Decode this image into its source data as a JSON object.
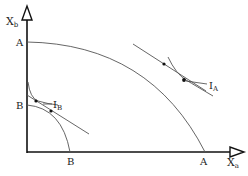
{
  "diagram": {
    "axes": {
      "y_label_main": "X",
      "y_label_sub": "b",
      "x_label_main": "X",
      "x_label_sub": "a"
    },
    "labels": {
      "ppf_a_y_intercept": "A",
      "ppf_a_x_intercept": "A",
      "ppf_b_y_intercept": "B",
      "ppf_b_x_intercept": "B",
      "indifference_a_main": "I",
      "indifference_a_sub": "A",
      "indifference_b_main": "I",
      "indifference_b_sub": "B"
    },
    "colors": {
      "axis": "#111111",
      "curve": "#555555",
      "background": "#ffffff"
    }
  }
}
